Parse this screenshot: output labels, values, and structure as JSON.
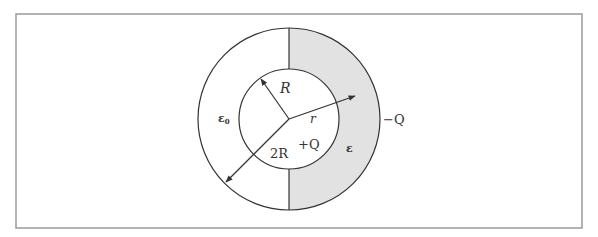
{
  "figure": {
    "frame": {
      "x": 16,
      "y": 14,
      "width": 566,
      "height": 214,
      "stroke": "#9a9a9a"
    },
    "center": {
      "x": 289,
      "y": 119
    },
    "outer_radius": 91,
    "inner_radius": 50,
    "dielectric_fill": "#e2e2e2",
    "line_color": "#333333",
    "labels": {
      "inner_radius": "R",
      "field_point": "r",
      "outer_radius": "2R",
      "inner_charge": "+Q",
      "outer_charge": "−Q",
      "vacuum_permittivity": "ε",
      "vacuum_subscript": "0",
      "dielectric_permittivity": "ε"
    },
    "regions": {
      "left_half": "vacuum (ε0)",
      "right_half": "dielectric (ε)"
    }
  }
}
